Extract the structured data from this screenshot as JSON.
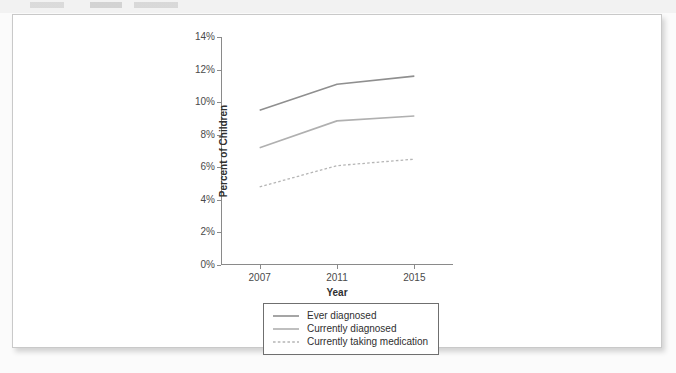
{
  "chart_data": {
    "type": "line",
    "title": "",
    "xlabel": "Year",
    "ylabel": "Percent of Children",
    "x": [
      2007,
      2011,
      2015
    ],
    "categories": [
      "2007",
      "2011",
      "2015"
    ],
    "xlim": [
      2005,
      2017
    ],
    "ylim": [
      0,
      14
    ],
    "yticks": [
      0,
      2,
      4,
      6,
      8,
      10,
      12,
      14
    ],
    "ytick_labels": [
      "0%",
      "2%",
      "4%",
      "6%",
      "8%",
      "10%",
      "12%",
      "14%"
    ],
    "xticks": [
      2007,
      2011,
      2015
    ],
    "xtick_labels": [
      "2007",
      "2011",
      "2015"
    ],
    "grid": false,
    "legend_position": "below",
    "series": [
      {
        "name": "Ever diagnosed",
        "values": [
          9.5,
          11.1,
          11.6
        ],
        "color": "#8f8f8f",
        "style": "solid"
      },
      {
        "name": "Currently diagnosed",
        "values": [
          7.2,
          8.85,
          9.15
        ],
        "color": "#b0b0b0",
        "style": "solid"
      },
      {
        "name": "Currently taking medication",
        "values": [
          4.8,
          6.1,
          6.5
        ],
        "color": "#b5b5b5",
        "style": "dashed"
      }
    ]
  },
  "legend": {
    "items": [
      {
        "label": "Ever diagnosed"
      },
      {
        "label": "Currently diagnosed"
      },
      {
        "label": "Currently taking medication"
      }
    ]
  },
  "page": {
    "background_color": "#ffffff",
    "border_color": "#c9c9c9"
  }
}
